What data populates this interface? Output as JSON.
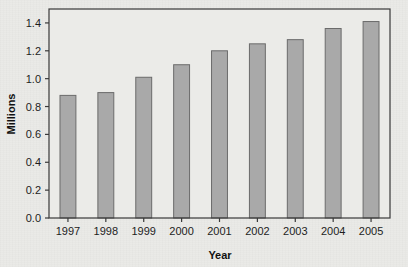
{
  "chart_data": {
    "type": "bar",
    "title": "",
    "xlabel": "Year",
    "ylabel": "Millions",
    "categories": [
      "1997",
      "1998",
      "1999",
      "2000",
      "2001",
      "2002",
      "2003",
      "2004",
      "2005"
    ],
    "values": [
      0.88,
      0.9,
      1.01,
      1.1,
      1.2,
      1.25,
      1.28,
      1.36,
      1.41
    ],
    "series": [
      {
        "name": "Millions",
        "values": [
          0.88,
          0.9,
          1.01,
          1.1,
          1.2,
          1.25,
          1.28,
          1.36,
          1.41
        ]
      }
    ],
    "ylim": [
      0.0,
      1.5
    ],
    "yticks": [
      "0.0",
      "0.2",
      "0.4",
      "0.6",
      "0.8",
      "1.0",
      "1.2",
      "1.4"
    ],
    "ytick_values": [
      0.0,
      0.2,
      0.4,
      0.6,
      0.8,
      1.0,
      1.2,
      1.4
    ],
    "grid": false,
    "legend": "none",
    "colors": {
      "bar_fill": "#a9a9a9",
      "bar_stroke": "#6b6b6b",
      "axis": "#3a3a3a",
      "plot_background": "#ebebe8",
      "figure_background": "#e9e9e6",
      "text": "#1d1d1d"
    }
  }
}
